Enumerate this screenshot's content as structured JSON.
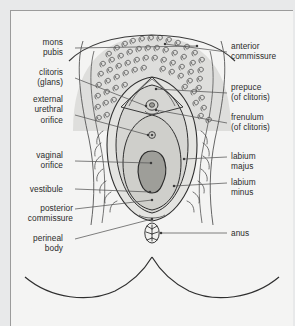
{
  "figure": {
    "type": "anatomical-line-diagram",
    "colors": {
      "page_background": "#e8e9ea",
      "panel_background": "#f4f4f3",
      "panel_border": "#9b9b9b",
      "ink": "#2b2b2b",
      "leader_line": "#555555",
      "mons_fill": "#dededc",
      "labium_majus_fill": "#e4e4e1",
      "labium_minus_fill": "#d6d6d3",
      "vestibule_fill": "#cfcfcb",
      "vaginal_orifice_fill": "#9e9e99",
      "text": "#2b2b2b"
    }
  },
  "labels_left": [
    {
      "id": "mons-pubis",
      "lines": "mons\npubis"
    },
    {
      "id": "clitoris-glans",
      "lines": "clitoris\n(glans)"
    },
    {
      "id": "external-urethral-orifice",
      "lines": "external\nurethral\norifice"
    },
    {
      "id": "vaginal-orifice",
      "lines": "vaginal\norifice"
    },
    {
      "id": "vestibule",
      "lines": "vestibule"
    },
    {
      "id": "posterior-commissure",
      "lines": "posterior\ncommissure"
    },
    {
      "id": "perineal-body",
      "lines": "perineal\nbody"
    }
  ],
  "labels_right": [
    {
      "id": "anterior-commissure",
      "lines": "anterior\ncommissure"
    },
    {
      "id": "prepuce-of-clitoris",
      "lines": "prepuce\n(of clitoris)"
    },
    {
      "id": "frenulum-of-clitoris",
      "lines": "frenulum\n(of clitoris)"
    },
    {
      "id": "labium-majus",
      "lines": "labium\nmajus"
    },
    {
      "id": "labium-minus",
      "lines": "labium\nminus"
    },
    {
      "id": "anus",
      "lines": "anus"
    }
  ]
}
